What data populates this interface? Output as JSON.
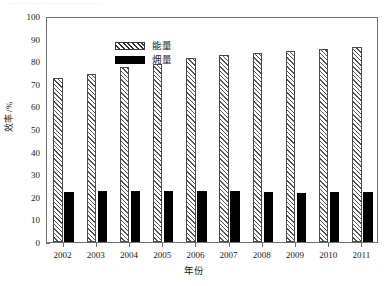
{
  "figure": {
    "top_remnant_text": "———————————————",
    "background_color": "#ffffff",
    "axis_color": "#6f6f6f"
  },
  "legend": {
    "position": "top-left-inside",
    "items": [
      {
        "label": "能量",
        "swatch": "hatched-diagonal-swatch",
        "color": "#ffffff"
      },
      {
        "label": "㶲量",
        "swatch": "solid-black-swatch",
        "color": "#000000"
      }
    ]
  },
  "chart_data": {
    "type": "bar",
    "title": "",
    "subtitle": "",
    "xlabel": "年份",
    "ylabel": "效率 /%",
    "categories": [
      "2002",
      "2003",
      "2004",
      "2005",
      "2006",
      "2007",
      "2008",
      "2009",
      "2010",
      "2011"
    ],
    "series": [
      {
        "name": "能量",
        "values": [
          72.5,
          74.5,
          77.3,
          78.8,
          81.3,
          82.6,
          83.8,
          84.6,
          85.6,
          86.5
        ],
        "fill": "diagonal-hatch",
        "color": "#ffffff",
        "edge_color": "#4a4a4a"
      },
      {
        "name": "㶲量",
        "values": [
          22.2,
          22.6,
          22.7,
          22.5,
          22.5,
          22.4,
          22.0,
          21.7,
          22.0,
          22.1
        ],
        "fill": "solid",
        "color": "#000000",
        "edge_color": "#000000"
      }
    ],
    "ylim": [
      0,
      100
    ],
    "yticks": [
      0,
      10,
      20,
      30,
      40,
      50,
      60,
      70,
      80,
      90,
      100
    ],
    "ytick_labels": [
      "0",
      "10",
      "20",
      "30",
      "40",
      "50",
      "60",
      "70",
      "80",
      "90",
      "100"
    ],
    "grid": false,
    "legend_position": "upper left"
  }
}
